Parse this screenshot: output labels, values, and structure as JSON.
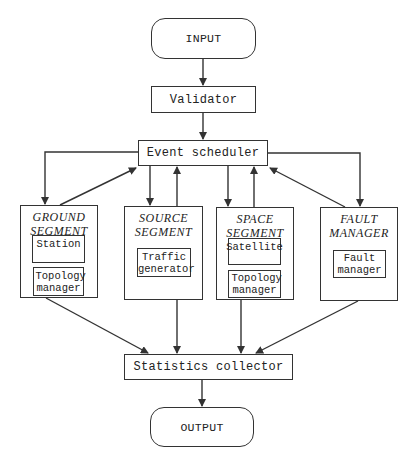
{
  "diagram": {
    "type": "flowchart",
    "nodes": {
      "input": "INPUT",
      "validator": "Validator",
      "scheduler": "Event scheduler",
      "collector": "Statistics collector",
      "output": "OUTPUT"
    },
    "segments": [
      {
        "title_line1": "GROUND",
        "title_line2": "SEGMENT",
        "components": [
          "Station",
          "Topology manager"
        ]
      },
      {
        "title_line1": "SOURCE",
        "title_line2": "SEGMENT",
        "components": [
          "Traffic generator"
        ]
      },
      {
        "title_line1": "SPACE",
        "title_line2": "SEGMENT",
        "components": [
          "Satellite",
          "Topology manager"
        ]
      },
      {
        "title_line1": "FAULT",
        "title_line2": "MANAGER",
        "components": [
          "Fault manager"
        ]
      }
    ],
    "edges": [
      [
        "INPUT",
        "Validator"
      ],
      [
        "Validator",
        "Event scheduler"
      ],
      [
        "Event scheduler",
        "GROUND SEGMENT"
      ],
      [
        "GROUND SEGMENT",
        "Event scheduler"
      ],
      [
        "Event scheduler",
        "SOURCE SEGMENT"
      ],
      [
        "SOURCE SEGMENT",
        "Event scheduler"
      ],
      [
        "Event scheduler",
        "SPACE SEGMENT"
      ],
      [
        "SPACE SEGMENT",
        "Event scheduler"
      ],
      [
        "Event scheduler",
        "FAULT MANAGER"
      ],
      [
        "FAULT MANAGER",
        "Event scheduler"
      ],
      [
        "GROUND SEGMENT",
        "Statistics collector"
      ],
      [
        "SOURCE SEGMENT",
        "Statistics collector"
      ],
      [
        "SPACE SEGMENT",
        "Statistics collector"
      ],
      [
        "FAULT MANAGER",
        "Statistics collector"
      ],
      [
        "Statistics collector",
        "OUTPUT"
      ]
    ],
    "colors": {
      "stroke": "#333333",
      "background": "#ffffff"
    }
  }
}
